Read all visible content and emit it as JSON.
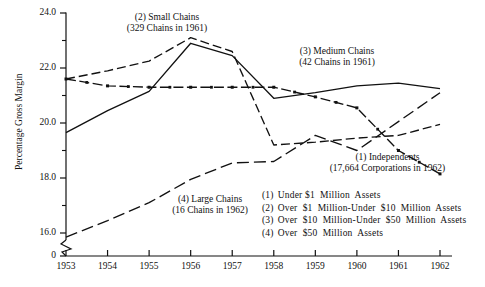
{
  "chart_data": {
    "type": "line",
    "title": "",
    "xlabel": "",
    "ylabel": "Percentage Gross Margin",
    "x": [
      1953,
      1954,
      1955,
      1956,
      1957,
      1958,
      1959,
      1960,
      1961,
      1962
    ],
    "xticklabels": [
      "1953",
      "1954",
      "1955",
      "1956",
      "1957",
      "1958",
      "1959",
      "1960",
      "1961",
      "1962"
    ],
    "yticklabels": [
      "24.0",
      "22.0",
      "20.0",
      "18.0",
      "16.0",
      "0"
    ],
    "ytickvalues": [
      24.0,
      22.0,
      20.0,
      18.0,
      16.0,
      0
    ],
    "yminorstep": 0.5,
    "ylim": [
      15.4,
      24.0
    ],
    "xlim": [
      1953,
      1962
    ],
    "axis_break": true,
    "axis_break_note": "0",
    "grid": false,
    "legend_position": "inside-lower-right",
    "series": [
      {
        "name": "(1) Independents",
        "key": "independents",
        "style": "dash-dot-marker",
        "values": [
          21.6,
          21.35,
          21.3,
          21.3,
          21.3,
          21.3,
          20.95,
          20.55,
          19.0,
          18.15
        ]
      },
      {
        "name": "(2) Small Chains",
        "key": "small_chains",
        "style": "dashed",
        "values": [
          21.6,
          21.9,
          22.25,
          23.1,
          22.6,
          19.2,
          19.3,
          19.45,
          19.55,
          19.95
        ]
      },
      {
        "name": "(3) Medium Chains",
        "key": "medium_chains",
        "style": "solid",
        "values": [
          19.65,
          20.45,
          21.15,
          22.9,
          22.45,
          20.9,
          21.1,
          21.35,
          21.45,
          21.25
        ]
      },
      {
        "name": "(4) Large Chains",
        "key": "large_chains",
        "style": "long-dash",
        "values": [
          15.85,
          16.45,
          17.1,
          17.95,
          18.55,
          18.6,
          19.55,
          19.0,
          20.05,
          21.1
        ]
      }
    ],
    "annotations": [
      {
        "name": "small-chains",
        "line1": "(2) Small Chains",
        "line2": "(329 Chains in 1961)"
      },
      {
        "name": "medium-chains",
        "line1": "(3) Medium Chains",
        "line2": "(42 Chains in 1961)"
      },
      {
        "name": "independents",
        "line1": "(1) Independents",
        "line2": "(17,664 Corporations in 1962)"
      },
      {
        "name": "large-chains",
        "line1": "(4) Large Chains",
        "line2": "(16 Chains in 1962)"
      }
    ],
    "legend_entries": [
      {
        "num": "(1)",
        "text": "Under $1  Million  Assets"
      },
      {
        "num": "(2)",
        "text": "Over  $1  Million-Under  $10  Million  Assets"
      },
      {
        "num": "(3)",
        "text": "Over  $10  Million-Under  $50  Million  Assets"
      },
      {
        "num": "(4)",
        "text": "Over  $50  Million  Assets"
      }
    ],
    "colors": {
      "ink": "#111111",
      "background": "#ffffff"
    }
  }
}
